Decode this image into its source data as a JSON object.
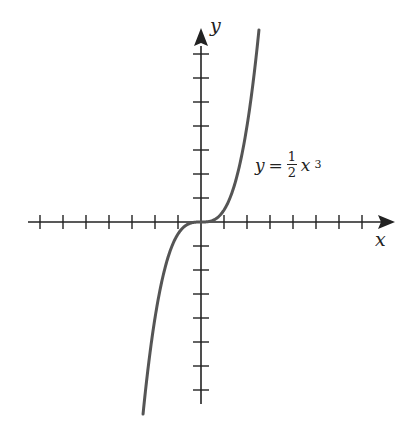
{
  "chart_data": {
    "type": "line",
    "title": "",
    "equation": {
      "lhs": "y",
      "eq": "=",
      "num": "1",
      "den": "2",
      "var": "x",
      "exp": "3"
    },
    "xlabel": "x",
    "ylabel": "y",
    "function": "y = (1/2) x^3",
    "xlim": [
      -7,
      7
    ],
    "ylim": [
      -7,
      7
    ],
    "x_ticks": [
      -7,
      -6,
      -5,
      -4,
      -3,
      -2,
      -1,
      1,
      2,
      3,
      4,
      5,
      6,
      7
    ],
    "y_ticks": [
      -7,
      -6,
      -5,
      -4,
      -3,
      -2,
      -1,
      1,
      2,
      3,
      4,
      5,
      6,
      7
    ],
    "tick_labels_shown": false,
    "grid": false,
    "series": [
      {
        "name": "y = 1/2 x^3",
        "x": [
          -2.5,
          -2,
          -1.5,
          -1,
          -0.5,
          0,
          0.5,
          1,
          1.5,
          2,
          2.5
        ],
        "y": [
          -7.8,
          -4,
          -1.69,
          -0.5,
          -0.06,
          0,
          0.06,
          0.5,
          1.69,
          4,
          7.8
        ]
      }
    ],
    "colors": {
      "curve": "#555555",
      "axes": "#222222"
    }
  }
}
